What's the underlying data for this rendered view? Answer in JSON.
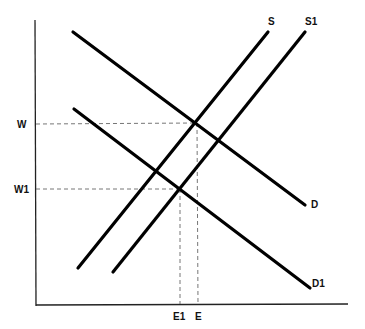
{
  "diagram": {
    "type": "supply-demand",
    "axes": {
      "y_axis": {
        "x": 35,
        "y1": 20,
        "y2": 306
      },
      "x_axis": {
        "y": 305,
        "x1": 37,
        "x2": 348
      }
    },
    "curves": [
      {
        "id": "S",
        "label": "S",
        "x1": 78,
        "y1": 268,
        "x2": 268,
        "y2": 32,
        "label_x": 268,
        "label_y": 25
      },
      {
        "id": "S1",
        "label": "S1",
        "x1": 113,
        "y1": 272,
        "x2": 305,
        "y2": 32,
        "label_x": 305,
        "label_y": 25
      },
      {
        "id": "D",
        "label": "D",
        "x1": 73,
        "y1": 32,
        "x2": 305,
        "y2": 205,
        "label_x": 310,
        "label_y": 208
      },
      {
        "id": "D1",
        "label": "D1",
        "x1": 74,
        "y1": 109,
        "x2": 310,
        "y2": 288,
        "label_x": 312,
        "label_y": 286
      }
    ],
    "equilibria": [
      {
        "id": "original",
        "wage_label": "W",
        "employment_label": "E",
        "x": 197,
        "y": 124
      },
      {
        "id": "new",
        "wage_label": "W1",
        "employment_label": "E1",
        "x": 180,
        "y": 189
      }
    ],
    "wage_labels": [
      {
        "text": "W",
        "x": 15,
        "y": 128
      },
      {
        "text": "W1",
        "x": 12,
        "y": 193
      }
    ],
    "employment_labels": [
      {
        "text": "E1",
        "x": 172,
        "y": 320
      },
      {
        "text": "E",
        "x": 194,
        "y": 320
      }
    ],
    "colors": {
      "curve": "#000000",
      "axis": "#222222",
      "guide": "#666666",
      "background": "#ffffff"
    }
  }
}
